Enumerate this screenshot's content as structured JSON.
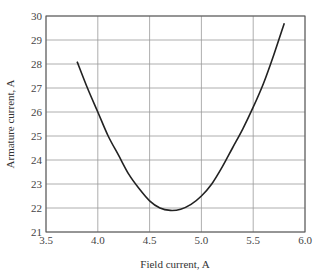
{
  "chart_data": {
    "type": "line",
    "title": "",
    "xlabel": "Field current, A",
    "ylabel": "Armature current, A",
    "xlim": [
      3.5,
      6.0
    ],
    "ylim": [
      21,
      30
    ],
    "xticks": [
      "3.5",
      "4.0",
      "4.5",
      "5.0",
      "5.5",
      "6.0"
    ],
    "yticks": [
      "21",
      "22",
      "23",
      "24",
      "25",
      "26",
      "27",
      "28",
      "29",
      "30"
    ],
    "grid": true,
    "legend": null,
    "series": [
      {
        "name": "V-curve",
        "x": [
          3.8,
          3.9,
          4.0,
          4.1,
          4.2,
          4.3,
          4.4,
          4.5,
          4.6,
          4.7,
          4.8,
          4.9,
          5.0,
          5.1,
          5.2,
          5.3,
          5.4,
          5.5,
          5.6,
          5.7,
          5.8
        ],
        "y": [
          28.1,
          27.0,
          26.0,
          25.0,
          24.2,
          23.4,
          22.8,
          22.3,
          22.0,
          21.9,
          21.95,
          22.15,
          22.5,
          23.0,
          23.7,
          24.5,
          25.3,
          26.2,
          27.2,
          28.4,
          29.7
        ]
      }
    ]
  }
}
